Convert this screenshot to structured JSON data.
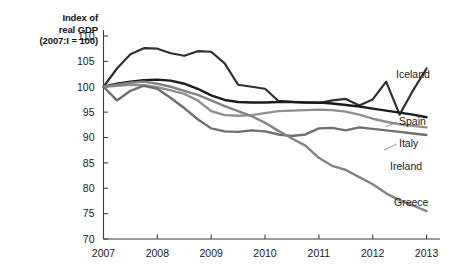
{
  "chart_data": {
    "type": "line",
    "title": "Index of real GDP",
    "title_line1": "Index of",
    "title_line2": "real GDP",
    "subtitle": "(2007:I = 100)",
    "xlabel": "",
    "ylabel": "Index of real GDP (2007:I = 100)",
    "xlim": [
      2007,
      2013.25
    ],
    "ylim": [
      70,
      110
    ],
    "grid": false,
    "legend_position": "right-inline-labels",
    "xticks": [
      "2007",
      "2008",
      "2009",
      "2010",
      "2011",
      "2012",
      "2013"
    ],
    "xtick_values": [
      2007,
      2008,
      2009,
      2010,
      2011,
      2012,
      2013
    ],
    "yticks": [
      "70",
      "75",
      "80",
      "85",
      "90",
      "95",
      "100",
      "105",
      "110"
    ],
    "ytick_values": [
      70,
      75,
      80,
      85,
      90,
      95,
      100,
      105,
      110
    ],
    "series": [
      {
        "name": "Iceland",
        "color": "#2f2f2f",
        "width": 2.2,
        "x": [
          2007.0,
          2007.25,
          2007.5,
          2007.75,
          2008.0,
          2008.25,
          2008.5,
          2008.75,
          2009.0,
          2009.25,
          2009.5,
          2009.75,
          2010.0,
          2010.25,
          2010.5,
          2010.75,
          2011.0,
          2011.25,
          2011.5,
          2011.75,
          2012.0,
          2012.25,
          2012.5,
          2012.75,
          2013.0
        ],
        "values": [
          100.0,
          103.6,
          106.4,
          107.6,
          107.5,
          106.6,
          106.1,
          107.0,
          106.9,
          104.6,
          100.4,
          100.0,
          99.6,
          97.2,
          97.0,
          96.9,
          96.8,
          97.3,
          97.6,
          96.3,
          97.5,
          101.0,
          94.5,
          99.3,
          103.6
        ]
      },
      {
        "name": "Spain",
        "color": "#1b1b1b",
        "width": 2.4,
        "x": [
          2007.0,
          2007.25,
          2007.5,
          2007.75,
          2008.0,
          2008.25,
          2008.5,
          2008.75,
          2009.0,
          2009.25,
          2009.5,
          2009.75,
          2010.0,
          2010.25,
          2010.5,
          2010.75,
          2011.0,
          2011.25,
          2011.5,
          2011.75,
          2012.0,
          2012.25,
          2012.5,
          2012.75,
          2013.0
        ],
        "values": [
          100.0,
          100.6,
          101.0,
          101.3,
          101.4,
          101.2,
          100.6,
          99.6,
          98.3,
          97.4,
          97.0,
          96.9,
          96.9,
          97.0,
          97.0,
          96.9,
          96.9,
          96.7,
          96.4,
          96.1,
          95.7,
          95.3,
          94.9,
          94.5,
          94.0
        ]
      },
      {
        "name": "Italy",
        "color": "#8f8f8f",
        "width": 2.4,
        "x": [
          2007.0,
          2007.25,
          2007.5,
          2007.75,
          2008.0,
          2008.25,
          2008.5,
          2008.75,
          2009.0,
          2009.25,
          2009.5,
          2009.75,
          2010.0,
          2010.25,
          2010.5,
          2010.75,
          2011.0,
          2011.25,
          2011.5,
          2011.75,
          2012.0,
          2012.25,
          2012.5,
          2012.75,
          2013.0
        ],
        "values": [
          100.0,
          100.2,
          100.4,
          100.3,
          99.9,
          99.3,
          98.6,
          97.3,
          95.2,
          94.4,
          94.3,
          94.4,
          94.8,
          95.2,
          95.3,
          95.4,
          95.5,
          95.4,
          95.1,
          94.5,
          93.7,
          93.1,
          92.6,
          92.3,
          92.0
        ]
      },
      {
        "name": "Ireland",
        "color": "#6f6f6f",
        "width": 2.4,
        "x": [
          2007.0,
          2007.25,
          2007.5,
          2007.75,
          2008.0,
          2008.25,
          2008.5,
          2008.75,
          2009.0,
          2009.25,
          2009.5,
          2009.75,
          2010.0,
          2010.25,
          2010.5,
          2010.75,
          2011.0,
          2011.25,
          2011.5,
          2011.75,
          2012.0,
          2012.25,
          2012.5,
          2012.75,
          2013.0
        ],
        "values": [
          100.0,
          97.3,
          99.2,
          100.2,
          99.6,
          97.8,
          95.8,
          93.6,
          91.8,
          91.2,
          91.1,
          91.4,
          91.2,
          90.6,
          90.3,
          90.6,
          91.8,
          91.9,
          91.4,
          92.0,
          91.7,
          91.4,
          91.1,
          90.8,
          90.5
        ]
      },
      {
        "name": "Greece",
        "color": "#828282",
        "width": 2.4,
        "x": [
          2007.0,
          2007.25,
          2007.5,
          2007.75,
          2008.0,
          2008.25,
          2008.5,
          2008.75,
          2009.0,
          2009.25,
          2009.5,
          2009.75,
          2010.0,
          2010.25,
          2010.5,
          2010.75,
          2011.0,
          2011.25,
          2011.5,
          2011.75,
          2012.0,
          2012.25,
          2012.5,
          2012.75,
          2013.0
        ],
        "values": [
          100.0,
          100.4,
          100.8,
          101.0,
          100.6,
          100.0,
          99.2,
          98.4,
          97.3,
          96.2,
          95.2,
          94.2,
          92.9,
          91.3,
          89.8,
          88.4,
          86.0,
          84.4,
          83.6,
          82.2,
          80.8,
          79.0,
          77.6,
          76.6,
          75.5
        ]
      }
    ]
  }
}
